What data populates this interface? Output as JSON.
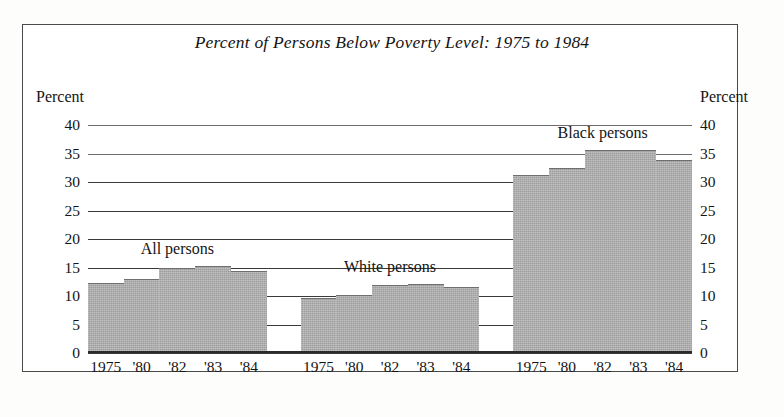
{
  "figure": {
    "title": "Percent of Persons Below Poverty Level: 1975 to 1984",
    "left_axis_caption": "Percent",
    "right_axis_caption": "Percent"
  },
  "chart_data": {
    "type": "bar",
    "title": "Percent of Persons Below Poverty Level: 1975 to 1984",
    "xlabel": "",
    "ylabel": "Percent",
    "ylim": [
      0,
      40
    ],
    "yticks": [
      0,
      5,
      10,
      15,
      20,
      25,
      30,
      35,
      40
    ],
    "grid": true,
    "legend": "none",
    "annotations": [
      "All persons",
      "White persons",
      "Black persons"
    ],
    "categories": [
      "1975",
      "'80",
      "'82",
      "'83",
      "'84"
    ],
    "groups": [
      {
        "name": "All persons",
        "label": "All persons",
        "categories": [
          "1975",
          "'80",
          "'82",
          "'83",
          "'84"
        ],
        "values": [
          12.3,
          13.0,
          15.0,
          15.2,
          14.4
        ]
      },
      {
        "name": "White persons",
        "label": "White persons",
        "categories": [
          "1975",
          "'80",
          "'82",
          "'83",
          "'84"
        ],
        "values": [
          9.7,
          10.2,
          12.0,
          12.1,
          11.5
        ]
      },
      {
        "name": "Black persons",
        "label": "Black persons",
        "categories": [
          "1975",
          "'80",
          "'82",
          "'83",
          "'84"
        ],
        "values": [
          31.3,
          32.5,
          35.6,
          35.7,
          33.8
        ]
      }
    ],
    "colors": {
      "bar_fill": "#9d9d9d",
      "bar_edge": "#6f6f6f",
      "gridline": "#3a3a3a",
      "text": "#141414",
      "frame": "#4a4a4a",
      "background": "#ffffff"
    }
  }
}
